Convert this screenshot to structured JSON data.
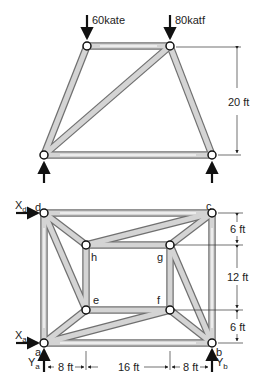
{
  "top_truss": {
    "loads": [
      {
        "label": "60kate",
        "node": "top-left"
      },
      {
        "label": "80katf",
        "node": "top-right"
      }
    ],
    "height_dimension": "20 ft",
    "supports": [
      "bottom-left",
      "bottom-right"
    ]
  },
  "bottom_truss": {
    "nodes": [
      "a",
      "b",
      "c",
      "d",
      "e",
      "f",
      "g",
      "h"
    ],
    "node_labels": {
      "a": "a",
      "b": "b",
      "c": "c",
      "d": "d",
      "e": "e",
      "f": "f",
      "g": "g",
      "h": "h"
    },
    "reactions": {
      "xd": {
        "main": "X",
        "sub": "d"
      },
      "xa": {
        "main": "X",
        "sub": "a"
      },
      "ya": {
        "main": "Y",
        "sub": "a"
      },
      "yb": {
        "main": "Y",
        "sub": "b"
      }
    },
    "vertical_dims": [
      "6 ft",
      "12 ft",
      "6 ft"
    ],
    "horizontal_dims": [
      "8 ft",
      "16 ft",
      "8 ft"
    ]
  },
  "colors": {
    "member_fill": "#c8c8c8",
    "member_stroke": "#6e6e6e",
    "node_fill": "#ffffff",
    "ink": "#111111"
  }
}
